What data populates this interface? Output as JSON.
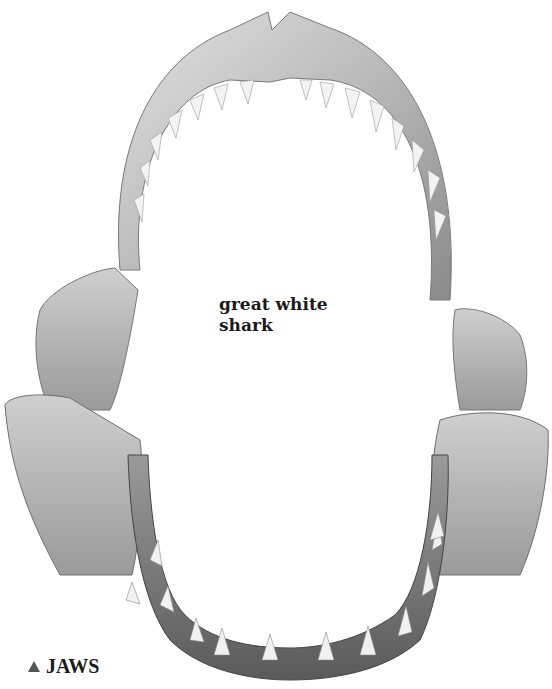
{
  "image": {
    "subject": "shark jaws photograph",
    "palette": {
      "bone_light": "#d9d9d9",
      "bone_mid": "#a8a8a8",
      "bone_dark": "#6b6b6b",
      "tooth": "#f2f2f2",
      "background": "#ffffff"
    }
  },
  "labels": {
    "species_line1": "great white",
    "species_line2": "shark"
  },
  "caption": {
    "marker": "triangle-up",
    "text": "JAWS"
  }
}
